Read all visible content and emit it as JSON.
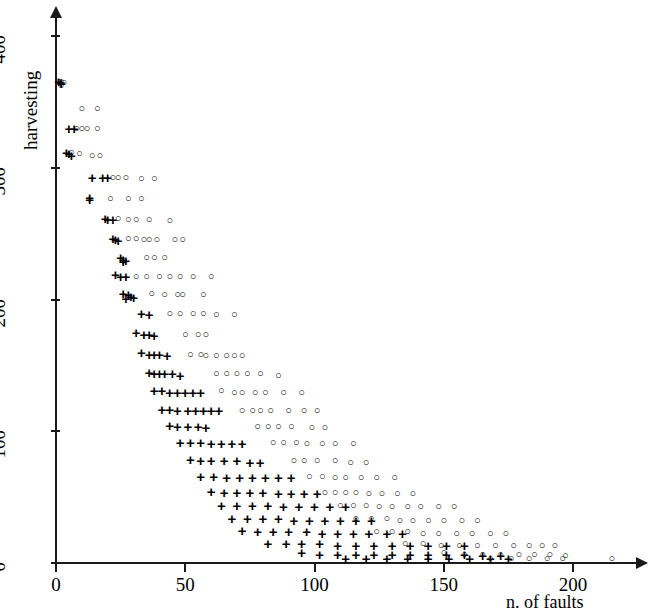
{
  "chart_data": {
    "type": "scatter",
    "title": "",
    "xlabel": "n. of faults",
    "ylabel": "harvesting",
    "xlim": [
      0,
      230
    ],
    "ylim": [
      0,
      420
    ],
    "xticks": [
      0,
      50,
      100,
      150,
      200
    ],
    "yticks": [
      0,
      100,
      200,
      300,
      400
    ],
    "xtick_labels": [
      "0",
      "50",
      "100",
      "150",
      "200"
    ],
    "ytick_labels": [
      "0",
      "100",
      "200",
      "300",
      "400"
    ],
    "grid": false,
    "legend": "none",
    "series": [
      {
        "name": "circle",
        "marker": "o",
        "points": [
          [
            1,
            366
          ],
          [
            2,
            366
          ],
          [
            3,
            365
          ],
          [
            2,
            363
          ],
          [
            10,
            345
          ],
          [
            16,
            345
          ],
          [
            8,
            330
          ],
          [
            10,
            330
          ],
          [
            12,
            330
          ],
          [
            16,
            330
          ],
          [
            6,
            312
          ],
          [
            9,
            311
          ],
          [
            14,
            310
          ],
          [
            17,
            310
          ],
          [
            22,
            293
          ],
          [
            24,
            293
          ],
          [
            27,
            293
          ],
          [
            33,
            292
          ],
          [
            38,
            292
          ],
          [
            21,
            277
          ],
          [
            28,
            277
          ],
          [
            33,
            277
          ],
          [
            24,
            262
          ],
          [
            28,
            261
          ],
          [
            31,
            261
          ],
          [
            36,
            261
          ],
          [
            44,
            260
          ],
          [
            28,
            247
          ],
          [
            31,
            247
          ],
          [
            34,
            246
          ],
          [
            36,
            246
          ],
          [
            39,
            246
          ],
          [
            46,
            246
          ],
          [
            49,
            246
          ],
          [
            35,
            232
          ],
          [
            38,
            232
          ],
          [
            42,
            232
          ],
          [
            31,
            218
          ],
          [
            35,
            218
          ],
          [
            40,
            218
          ],
          [
            44,
            218
          ],
          [
            48,
            218
          ],
          [
            53,
            218
          ],
          [
            60,
            218
          ],
          [
            37,
            205
          ],
          [
            42,
            204
          ],
          [
            47,
            204
          ],
          [
            49,
            204
          ],
          [
            57,
            204
          ],
          [
            44,
            190
          ],
          [
            48,
            190
          ],
          [
            53,
            190
          ],
          [
            57,
            190
          ],
          [
            62,
            189
          ],
          [
            69,
            189
          ],
          [
            50,
            174
          ],
          [
            55,
            174
          ],
          [
            58,
            174
          ],
          [
            52,
            159
          ],
          [
            56,
            159
          ],
          [
            58,
            158
          ],
          [
            62,
            158
          ],
          [
            66,
            158
          ],
          [
            69,
            158
          ],
          [
            72,
            158
          ],
          [
            62,
            144
          ],
          [
            66,
            144
          ],
          [
            70,
            144
          ],
          [
            74,
            144
          ],
          [
            79,
            144
          ],
          [
            86,
            143
          ],
          [
            64,
            131
          ],
          [
            69,
            130
          ],
          [
            72,
            130
          ],
          [
            77,
            130
          ],
          [
            81,
            130
          ],
          [
            88,
            130
          ],
          [
            95,
            130
          ],
          [
            72,
            116
          ],
          [
            76,
            116
          ],
          [
            79,
            116
          ],
          [
            83,
            116
          ],
          [
            90,
            116
          ],
          [
            96,
            116
          ],
          [
            101,
            116
          ],
          [
            78,
            104
          ],
          [
            82,
            104
          ],
          [
            86,
            104
          ],
          [
            91,
            104
          ],
          [
            99,
            103
          ],
          [
            104,
            103
          ],
          [
            84,
            92
          ],
          [
            88,
            92
          ],
          [
            93,
            92
          ],
          [
            97,
            91
          ],
          [
            103,
            91
          ],
          [
            108,
            91
          ],
          [
            115,
            91
          ],
          [
            92,
            78
          ],
          [
            96,
            78
          ],
          [
            101,
            78
          ],
          [
            108,
            78
          ],
          [
            114,
            77
          ],
          [
            120,
            77
          ],
          [
            98,
            66
          ],
          [
            103,
            66
          ],
          [
            108,
            65
          ],
          [
            112,
            65
          ],
          [
            118,
            65
          ],
          [
            124,
            65
          ],
          [
            131,
            65
          ],
          [
            104,
            54
          ],
          [
            108,
            54
          ],
          [
            112,
            54
          ],
          [
            116,
            54
          ],
          [
            121,
            53
          ],
          [
            126,
            53
          ],
          [
            132,
            53
          ],
          [
            138,
            53
          ],
          [
            110,
            44
          ],
          [
            115,
            44
          ],
          [
            120,
            44
          ],
          [
            125,
            43
          ],
          [
            130,
            43
          ],
          [
            136,
            43
          ],
          [
            141,
            43
          ],
          [
            148,
            43
          ],
          [
            154,
            43
          ],
          [
            116,
            34
          ],
          [
            122,
            34
          ],
          [
            128,
            34
          ],
          [
            133,
            33
          ],
          [
            138,
            33
          ],
          [
            144,
            33
          ],
          [
            150,
            33
          ],
          [
            157,
            33
          ],
          [
            163,
            33
          ],
          [
            124,
            24
          ],
          [
            130,
            24
          ],
          [
            136,
            24
          ],
          [
            142,
            23
          ],
          [
            148,
            23
          ],
          [
            155,
            23
          ],
          [
            161,
            23
          ],
          [
            168,
            23
          ],
          [
            174,
            23
          ],
          [
            135,
            15
          ],
          [
            142,
            15
          ],
          [
            149,
            14
          ],
          [
            156,
            14
          ],
          [
            163,
            14
          ],
          [
            170,
            14
          ],
          [
            177,
            14
          ],
          [
            183,
            14
          ],
          [
            188,
            14
          ],
          [
            193,
            14
          ],
          [
            150,
            8
          ],
          [
            158,
            7
          ],
          [
            165,
            7
          ],
          [
            172,
            7
          ],
          [
            179,
            7
          ],
          [
            185,
            7
          ],
          [
            191,
            7
          ],
          [
            197,
            6
          ],
          [
            168,
            4
          ],
          [
            176,
            4
          ],
          [
            183,
            4
          ],
          [
            190,
            4
          ],
          [
            196,
            4
          ],
          [
            215,
            4
          ]
        ]
      },
      {
        "name": "plus",
        "marker": "+",
        "points": [
          [
            1,
            366
          ],
          [
            2,
            365
          ],
          [
            2,
            364
          ],
          [
            5,
            330
          ],
          [
            7,
            330
          ],
          [
            4,
            312
          ],
          [
            5,
            311
          ],
          [
            6,
            310
          ],
          [
            14,
            293
          ],
          [
            18,
            293
          ],
          [
            20,
            293
          ],
          [
            13,
            278
          ],
          [
            13,
            276
          ],
          [
            19,
            262
          ],
          [
            20,
            261
          ],
          [
            22,
            261
          ],
          [
            22,
            247
          ],
          [
            23,
            246
          ],
          [
            24,
            245
          ],
          [
            25,
            232
          ],
          [
            26,
            231
          ],
          [
            27,
            230
          ],
          [
            26,
            229
          ],
          [
            23,
            219
          ],
          [
            25,
            218
          ],
          [
            27,
            218
          ],
          [
            26,
            205
          ],
          [
            28,
            204
          ],
          [
            29,
            203
          ],
          [
            30,
            202
          ],
          [
            27,
            201
          ],
          [
            33,
            190
          ],
          [
            36,
            189
          ],
          [
            31,
            175
          ],
          [
            34,
            174
          ],
          [
            36,
            174
          ],
          [
            38,
            173
          ],
          [
            33,
            160
          ],
          [
            36,
            159
          ],
          [
            38,
            159
          ],
          [
            40,
            159
          ],
          [
            43,
            158
          ],
          [
            36,
            145
          ],
          [
            38,
            144
          ],
          [
            40,
            144
          ],
          [
            42,
            144
          ],
          [
            45,
            144
          ],
          [
            48,
            143
          ],
          [
            38,
            131
          ],
          [
            41,
            131
          ],
          [
            44,
            130
          ],
          [
            47,
            130
          ],
          [
            50,
            130
          ],
          [
            53,
            130
          ],
          [
            56,
            130
          ],
          [
            41,
            117
          ],
          [
            44,
            117
          ],
          [
            47,
            116
          ],
          [
            51,
            116
          ],
          [
            54,
            116
          ],
          [
            57,
            116
          ],
          [
            60,
            116
          ],
          [
            63,
            116
          ],
          [
            44,
            105
          ],
          [
            47,
            104
          ],
          [
            51,
            104
          ],
          [
            55,
            104
          ],
          [
            58,
            103
          ],
          [
            48,
            92
          ],
          [
            52,
            92
          ],
          [
            56,
            92
          ],
          [
            60,
            91
          ],
          [
            64,
            91
          ],
          [
            68,
            91
          ],
          [
            72,
            91
          ],
          [
            52,
            79
          ],
          [
            56,
            78
          ],
          [
            60,
            78
          ],
          [
            65,
            78
          ],
          [
            70,
            78
          ],
          [
            75,
            77
          ],
          [
            79,
            77
          ],
          [
            56,
            66
          ],
          [
            61,
            66
          ],
          [
            66,
            65
          ],
          [
            71,
            65
          ],
          [
            76,
            65
          ],
          [
            81,
            65
          ],
          [
            86,
            65
          ],
          [
            91,
            65
          ],
          [
            60,
            55
          ],
          [
            65,
            54
          ],
          [
            70,
            54
          ],
          [
            75,
            54
          ],
          [
            80,
            54
          ],
          [
            86,
            53
          ],
          [
            91,
            53
          ],
          [
            96,
            53
          ],
          [
            101,
            53
          ],
          [
            64,
            44
          ],
          [
            70,
            44
          ],
          [
            76,
            44
          ],
          [
            82,
            44
          ],
          [
            88,
            43
          ],
          [
            94,
            43
          ],
          [
            100,
            43
          ],
          [
            106,
            43
          ],
          [
            112,
            43
          ],
          [
            68,
            34
          ],
          [
            74,
            34
          ],
          [
            80,
            34
          ],
          [
            86,
            34
          ],
          [
            92,
            33
          ],
          [
            98,
            33
          ],
          [
            104,
            33
          ],
          [
            110,
            33
          ],
          [
            116,
            33
          ],
          [
            122,
            33
          ],
          [
            72,
            25
          ],
          [
            78,
            24
          ],
          [
            84,
            24
          ],
          [
            90,
            24
          ],
          [
            97,
            24
          ],
          [
            103,
            23
          ],
          [
            109,
            23
          ],
          [
            115,
            23
          ],
          [
            121,
            23
          ],
          [
            128,
            23
          ],
          [
            134,
            23
          ],
          [
            82,
            15
          ],
          [
            89,
            15
          ],
          [
            95,
            15
          ],
          [
            102,
            15
          ],
          [
            109,
            14
          ],
          [
            116,
            14
          ],
          [
            123,
            14
          ],
          [
            130,
            14
          ],
          [
            137,
            14
          ],
          [
            144,
            14
          ],
          [
            151,
            14
          ],
          [
            158,
            14
          ],
          [
            95,
            8
          ],
          [
            102,
            7
          ],
          [
            109,
            7
          ],
          [
            116,
            7
          ],
          [
            123,
            7
          ],
          [
            130,
            7
          ],
          [
            137,
            7
          ],
          [
            144,
            7
          ],
          [
            151,
            7
          ],
          [
            158,
            7
          ],
          [
            165,
            6
          ],
          [
            172,
            6
          ],
          [
            112,
            4
          ],
          [
            120,
            4
          ],
          [
            128,
            4
          ],
          [
            136,
            4
          ],
          [
            144,
            4
          ],
          [
            152,
            4
          ],
          [
            160,
            4
          ],
          [
            168,
            4
          ],
          [
            175,
            4
          ]
        ]
      }
    ]
  }
}
